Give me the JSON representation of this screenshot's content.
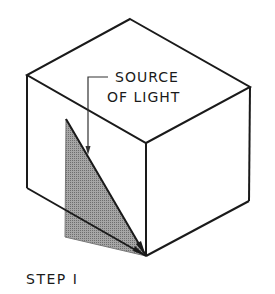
{
  "figure": {
    "callout_line1": "SOURCE",
    "callout_line2": "OF LIGHT",
    "step_label": "STEP I"
  },
  "colors": {
    "line": "#1a1a1a",
    "shadow_fill": "#8c8c8c",
    "background": "#ffffff"
  }
}
